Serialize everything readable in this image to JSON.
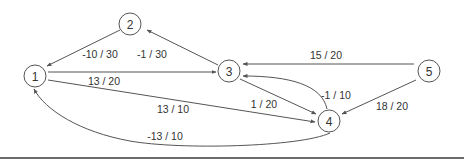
{
  "graph": {
    "nodes": [
      {
        "id": "1",
        "label": "1",
        "x": 35,
        "y": 76
      },
      {
        "id": "2",
        "label": "2",
        "x": 130,
        "y": 24
      },
      {
        "id": "3",
        "label": "3",
        "x": 229,
        "y": 71
      },
      {
        "id": "4",
        "label": "4",
        "x": 329,
        "y": 121
      },
      {
        "id": "5",
        "label": "5",
        "x": 429,
        "y": 71
      }
    ],
    "edges": [
      {
        "from": "2",
        "to": "1",
        "label": "-10 / 30"
      },
      {
        "from": "3",
        "to": "2",
        "label": "-1 / 30"
      },
      {
        "from": "1",
        "to": "3",
        "label": "13 / 20"
      },
      {
        "from": "5",
        "to": "3",
        "label": "15 / 20"
      },
      {
        "from": "1",
        "to": "4",
        "label": "13 / 10"
      },
      {
        "from": "3",
        "to": "4",
        "label": "1 / 20"
      },
      {
        "from": "4",
        "to": "3",
        "label": "-1 / 10"
      },
      {
        "from": "5",
        "to": "4",
        "label": "18 / 20"
      },
      {
        "from": "4",
        "to": "1",
        "label": "-13 / 10"
      }
    ]
  },
  "colors": {
    "stroke": "#555555",
    "text": "#333333",
    "rule": "#6b6b6b"
  }
}
